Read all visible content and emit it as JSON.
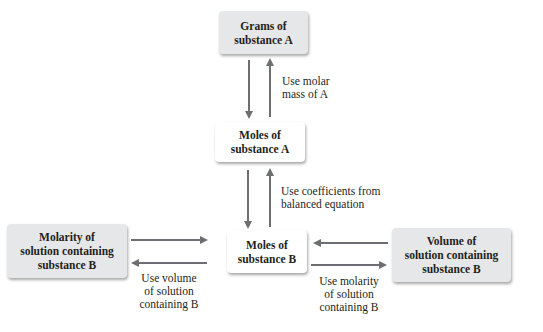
{
  "diagram": {
    "title": "",
    "colors": {
      "shaded_box": "#e6e7e8",
      "plain_box": "#ffffff",
      "arrow": "#6d6e71",
      "text": "#231f20"
    },
    "nodes": [
      {
        "id": "grams_a",
        "label": "Grams of\nsubstance A",
        "style": "shaded"
      },
      {
        "id": "moles_a",
        "label": "Moles of\nsubstance A",
        "style": "plain"
      },
      {
        "id": "moles_b",
        "label": "Moles of\nsubstance B",
        "style": "plain"
      },
      {
        "id": "molarity_b",
        "label": "Molarity of\nsolution containing\nsubstance B",
        "style": "shaded"
      },
      {
        "id": "volume_b",
        "label": "Volume of\nsolution containing\nsubstance B",
        "style": "shaded"
      }
    ],
    "edges": [
      {
        "from": "grams_a",
        "to": "moles_a",
        "label": ""
      },
      {
        "from": "moles_a",
        "to": "grams_a",
        "label": ""
      },
      {
        "from": "moles_a",
        "to": "moles_b",
        "label": ""
      },
      {
        "from": "moles_b",
        "to": "moles_a",
        "label": ""
      },
      {
        "from": "molarity_b",
        "to": "moles_b",
        "label": ""
      },
      {
        "from": "moles_b",
        "to": "molarity_b",
        "label": ""
      },
      {
        "from": "volume_b",
        "to": "moles_b",
        "label": ""
      },
      {
        "from": "moles_b",
        "to": "volume_b",
        "label": ""
      }
    ],
    "edge_labels": {
      "grams_moles_a": "Use molar\nmass of A",
      "moles_a_moles_b": "Use coefficients from\nbalanced equation",
      "molarity_moles_b": "Use volume\nof solution\ncontaining B",
      "volume_moles_b": "Use molarity\nof solution\ncontaining B"
    }
  }
}
